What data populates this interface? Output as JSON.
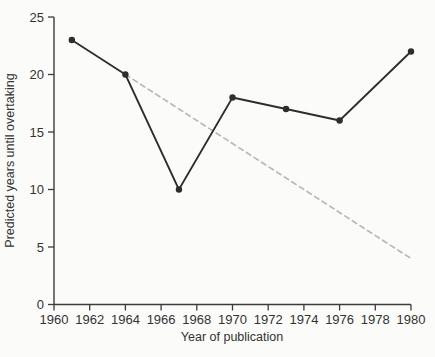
{
  "chart_data": {
    "type": "line",
    "title": "",
    "xlabel": "Year of publication",
    "ylabel": "Predicted years until overtaking",
    "xlim": [
      1960,
      1980
    ],
    "ylim": [
      0,
      25
    ],
    "x_ticks": [
      1960,
      1962,
      1964,
      1966,
      1968,
      1970,
      1972,
      1974,
      1976,
      1978,
      1980
    ],
    "y_ticks": [
      0,
      5,
      10,
      15,
      20,
      25
    ],
    "grid": false,
    "legend": "none",
    "series": [
      {
        "name": "predictions",
        "line_style": "solid",
        "marker": "filled-circle",
        "color": "#2d2d2d",
        "x": [
          1961,
          1964,
          1967,
          1970,
          1973,
          1976,
          1980
        ],
        "y": [
          23,
          20,
          10,
          18,
          17,
          16,
          22
        ]
      },
      {
        "name": "trend",
        "line_style": "dashed",
        "marker": "none",
        "color": "#b9b9b9",
        "x": [
          1964,
          1980
        ],
        "y": [
          20,
          4
        ]
      }
    ],
    "colors": {
      "axis": "#3c3c3c",
      "text": "#333333",
      "background": "#fbfbfa"
    }
  }
}
